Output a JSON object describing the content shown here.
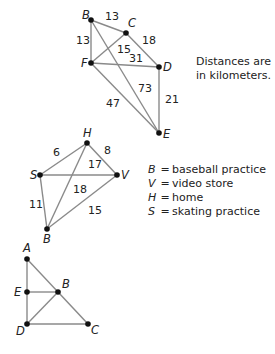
{
  "graph1": {
    "nodes": [
      {
        "id": "B",
        "x": 91,
        "y": 20,
        "lx": 82,
        "ly": 19
      },
      {
        "id": "C",
        "x": 126,
        "y": 33,
        "lx": 128,
        "ly": 27
      },
      {
        "id": "F",
        "x": 91,
        "y": 63,
        "lx": 81,
        "ly": 67
      },
      {
        "id": "D",
        "x": 159,
        "y": 67,
        "lx": 163,
        "ly": 71
      },
      {
        "id": "E",
        "x": 159,
        "y": 133,
        "lx": 163,
        "ly": 138
      }
    ],
    "edges": [
      {
        "from": "B",
        "to": "C",
        "weight": "13",
        "wx": 105,
        "wy": 20
      },
      {
        "from": "B",
        "to": "F",
        "weight": "13",
        "wx": 76,
        "wy": 44
      },
      {
        "from": "C",
        "to": "F",
        "weight": "15",
        "wx": 117,
        "wy": 53
      },
      {
        "from": "C",
        "to": "D",
        "weight": "18",
        "wx": 142,
        "wy": 44
      },
      {
        "from": "F",
        "to": "D",
        "weight": "31",
        "wx": 129,
        "wy": 62
      },
      {
        "from": "B",
        "to": "E",
        "weight": "73",
        "wx": 138,
        "wy": 92
      },
      {
        "from": "F",
        "to": "E",
        "weight": "47",
        "wx": 106,
        "wy": 107
      },
      {
        "from": "D",
        "to": "E",
        "weight": "21",
        "wx": 165,
        "wy": 103
      }
    ],
    "note_line1": "Distances are",
    "note_line2": "in kilometers."
  },
  "graph2": {
    "nodes": [
      {
        "id": "H",
        "x": 87,
        "y": 143,
        "lx": 83,
        "ly": 137
      },
      {
        "id": "S",
        "x": 40,
        "y": 175,
        "lx": 30,
        "ly": 179
      },
      {
        "id": "V",
        "x": 117,
        "y": 175,
        "lx": 121,
        "ly": 179
      },
      {
        "id": "B",
        "x": 47,
        "y": 229,
        "lx": 43,
        "ly": 243
      }
    ],
    "edges": [
      {
        "from": "H",
        "to": "S",
        "weight": "6",
        "wx": 53,
        "wy": 156
      },
      {
        "from": "H",
        "to": "V",
        "weight": "8",
        "wx": 104,
        "wy": 154
      },
      {
        "from": "S",
        "to": "V",
        "weight": "17",
        "wx": 88,
        "wy": 168
      },
      {
        "from": "H",
        "to": "B",
        "weight": "18",
        "wx": 73,
        "wy": 193
      },
      {
        "from": "S",
        "to": "B",
        "weight": "11",
        "wx": 29,
        "wy": 208
      },
      {
        "from": "V",
        "to": "B",
        "weight": "15",
        "wx": 88,
        "wy": 214
      }
    ],
    "legend": [
      {
        "key": "B",
        "eq": "=",
        "value": "baseball practice"
      },
      {
        "key": "V",
        "eq": "=",
        "value": "video store"
      },
      {
        "key": "H",
        "eq": "=",
        "value": "home"
      },
      {
        "key": "S",
        "eq": "=",
        "value": "skating practice"
      }
    ]
  },
  "graph3": {
    "nodes": [
      {
        "id": "A",
        "x": 27,
        "y": 259,
        "lx": 23,
        "ly": 252
      },
      {
        "id": "E",
        "x": 27,
        "y": 292,
        "lx": 14,
        "ly": 296
      },
      {
        "id": "B",
        "x": 58,
        "y": 292,
        "lx": 62,
        "ly": 288
      },
      {
        "id": "D",
        "x": 27,
        "y": 324,
        "lx": 16,
        "ly": 335
      },
      {
        "id": "C",
        "x": 88,
        "y": 324,
        "lx": 91,
        "ly": 334
      }
    ],
    "edges": [
      {
        "from": "A",
        "to": "E"
      },
      {
        "from": "E",
        "to": "D"
      },
      {
        "from": "A",
        "to": "B"
      },
      {
        "from": "B",
        "to": "C"
      },
      {
        "from": "E",
        "to": "B"
      },
      {
        "from": "D",
        "to": "B"
      },
      {
        "from": "D",
        "to": "C"
      }
    ]
  }
}
